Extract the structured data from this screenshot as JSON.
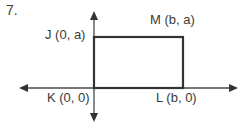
{
  "problem_number": "7.",
  "points": {
    "J": {
      "label": "J (0, a)",
      "x": 94,
      "y": 37
    },
    "M": {
      "label": "M (b, a)",
      "x": 183,
      "y": 37
    },
    "K": {
      "label": "K (0, 0)",
      "x": 94,
      "y": 88
    },
    "L": {
      "label": "L (b, 0)",
      "x": 183,
      "y": 88
    }
  },
  "axes": {
    "origin": {
      "x": 94,
      "y": 88
    },
    "x_axis": {
      "left_tip": 19,
      "right_tip": 238
    },
    "y_axis": {
      "top_tip": 11,
      "bottom_tip": 122
    }
  },
  "colors": {
    "axis": "#4a4a4a",
    "rectangle": "#333333",
    "text": "#3a3a3a"
  }
}
